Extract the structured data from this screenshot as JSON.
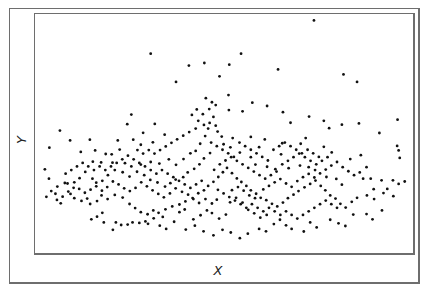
{
  "chart_data": {
    "type": "scatter",
    "title": "",
    "xlabel": "X",
    "ylabel": "Y",
    "xlim": [
      0,
      1
    ],
    "ylim": [
      0,
      1
    ],
    "grid": false,
    "legend": null,
    "ticks": "none",
    "marker_color": "#111111",
    "marker_radius": 1.4,
    "note": "Coordinates normalized to the plot area (x from left edge, y from bottom edge); no axis ticks or numeric labels are shown.",
    "points": [
      [
        0.738,
        0.973
      ],
      [
        0.545,
        0.834
      ],
      [
        0.514,
        0.788
      ],
      [
        0.643,
        0.768
      ],
      [
        0.816,
        0.747
      ],
      [
        0.852,
        0.716
      ],
      [
        0.407,
        0.784
      ],
      [
        0.488,
        0.739
      ],
      [
        0.306,
        0.834
      ],
      [
        0.448,
        0.795
      ],
      [
        0.373,
        0.716
      ],
      [
        0.512,
        0.661
      ],
      [
        0.575,
        0.629
      ],
      [
        0.549,
        0.593
      ],
      [
        0.468,
        0.631
      ],
      [
        0.513,
        0.598
      ],
      [
        0.614,
        0.615
      ],
      [
        0.656,
        0.589
      ],
      [
        0.676,
        0.545
      ],
      [
        0.725,
        0.571
      ],
      [
        0.764,
        0.553
      ],
      [
        0.778,
        0.522
      ],
      [
        0.812,
        0.537
      ],
      [
        0.857,
        0.542
      ],
      [
        0.959,
        0.558
      ],
      [
        0.911,
        0.502
      ],
      [
        0.958,
        0.448
      ],
      [
        0.962,
        0.429
      ],
      [
        0.965,
        0.398
      ],
      [
        0.862,
        0.409
      ],
      [
        0.877,
        0.359
      ],
      [
        0.834,
        0.393
      ],
      [
        0.785,
        0.421
      ],
      [
        0.764,
        0.444
      ],
      [
        0.716,
        0.481
      ],
      [
        0.703,
        0.457
      ],
      [
        0.654,
        0.459
      ],
      [
        0.651,
        0.413
      ],
      [
        0.608,
        0.475
      ],
      [
        0.593,
        0.443
      ],
      [
        0.571,
        0.486
      ],
      [
        0.523,
        0.481
      ],
      [
        0.517,
        0.442
      ],
      [
        0.542,
        0.42
      ],
      [
        0.571,
        0.401
      ],
      [
        0.583,
        0.37
      ],
      [
        0.614,
        0.361
      ],
      [
        0.636,
        0.351
      ],
      [
        0.671,
        0.355
      ],
      [
        0.701,
        0.366
      ],
      [
        0.724,
        0.359
      ],
      [
        0.741,
        0.347
      ],
      [
        0.771,
        0.318
      ],
      [
        0.797,
        0.31
      ],
      [
        0.812,
        0.286
      ],
      [
        0.868,
        0.311
      ],
      [
        0.888,
        0.311
      ],
      [
        0.917,
        0.304
      ],
      [
        0.896,
        0.267
      ],
      [
        0.932,
        0.268
      ],
      [
        0.947,
        0.304
      ],
      [
        0.962,
        0.289
      ],
      [
        0.978,
        0.299
      ],
      [
        0.255,
        0.579
      ],
      [
        0.244,
        0.539
      ],
      [
        0.286,
        0.503
      ],
      [
        0.317,
        0.54
      ],
      [
        0.343,
        0.495
      ],
      [
        0.312,
        0.463
      ],
      [
        0.28,
        0.453
      ],
      [
        0.26,
        0.474
      ],
      [
        0.224,
        0.433
      ],
      [
        0.219,
        0.471
      ],
      [
        0.203,
        0.413
      ],
      [
        0.187,
        0.414
      ],
      [
        0.159,
        0.429
      ],
      [
        0.145,
        0.474
      ],
      [
        0.121,
        0.423
      ],
      [
        0.093,
        0.471
      ],
      [
        0.066,
        0.512
      ],
      [
        0.038,
        0.441
      ],
      [
        0.153,
        0.382
      ],
      [
        0.175,
        0.379
      ],
      [
        0.205,
        0.378
      ],
      [
        0.238,
        0.376
      ],
      [
        0.255,
        0.362
      ],
      [
        0.28,
        0.37
      ],
      [
        0.306,
        0.381
      ],
      [
        0.329,
        0.374
      ],
      [
        0.354,
        0.392
      ],
      [
        0.373,
        0.369
      ],
      [
        0.393,
        0.393
      ],
      [
        0.411,
        0.417
      ],
      [
        0.425,
        0.427
      ],
      [
        0.437,
        0.457
      ],
      [
        0.45,
        0.489
      ],
      [
        0.458,
        0.521
      ],
      [
        0.462,
        0.544
      ],
      [
        0.472,
        0.569
      ],
      [
        0.478,
        0.533
      ],
      [
        0.483,
        0.508
      ],
      [
        0.494,
        0.487
      ],
      [
        0.499,
        0.455
      ],
      [
        0.463,
        0.418
      ],
      [
        0.447,
        0.396
      ],
      [
        0.435,
        0.371
      ],
      [
        0.421,
        0.352
      ],
      [
        0.404,
        0.337
      ],
      [
        0.392,
        0.317
      ],
      [
        0.372,
        0.307
      ],
      [
        0.358,
        0.292
      ],
      [
        0.344,
        0.278
      ],
      [
        0.324,
        0.295
      ],
      [
        0.305,
        0.306
      ],
      [
        0.289,
        0.326
      ],
      [
        0.27,
        0.34
      ],
      [
        0.25,
        0.32
      ],
      [
        0.232,
        0.338
      ],
      [
        0.211,
        0.347
      ],
      [
        0.193,
        0.326
      ],
      [
        0.178,
        0.302
      ],
      [
        0.162,
        0.294
      ],
      [
        0.152,
        0.311
      ],
      [
        0.133,
        0.339
      ],
      [
        0.118,
        0.313
      ],
      [
        0.104,
        0.296
      ],
      [
        0.086,
        0.291
      ],
      [
        0.059,
        0.278
      ],
      [
        0.026,
        0.35
      ],
      [
        0.037,
        0.311
      ],
      [
        0.03,
        0.235
      ],
      [
        0.054,
        0.248
      ],
      [
        0.068,
        0.208
      ],
      [
        0.079,
        0.293
      ],
      [
        0.094,
        0.247
      ],
      [
        0.104,
        0.229
      ],
      [
        0.123,
        0.218
      ],
      [
        0.138,
        0.228
      ],
      [
        0.146,
        0.205
      ],
      [
        0.164,
        0.217
      ],
      [
        0.176,
        0.241
      ],
      [
        0.192,
        0.226
      ],
      [
        0.211,
        0.243
      ],
      [
        0.232,
        0.232
      ],
      [
        0.25,
        0.205
      ],
      [
        0.265,
        0.188
      ],
      [
        0.28,
        0.171
      ],
      [
        0.298,
        0.162
      ],
      [
        0.313,
        0.178
      ],
      [
        0.327,
        0.168
      ],
      [
        0.345,
        0.183
      ],
      [
        0.363,
        0.195
      ],
      [
        0.382,
        0.203
      ],
      [
        0.398,
        0.216
      ],
      [
        0.417,
        0.23
      ],
      [
        0.432,
        0.25
      ],
      [
        0.447,
        0.262
      ],
      [
        0.458,
        0.281
      ],
      [
        0.472,
        0.298
      ],
      [
        0.485,
        0.318
      ],
      [
        0.497,
        0.338
      ],
      [
        0.508,
        0.356
      ],
      [
        0.521,
        0.334
      ],
      [
        0.534,
        0.312
      ],
      [
        0.546,
        0.297
      ],
      [
        0.559,
        0.281
      ],
      [
        0.571,
        0.262
      ],
      [
        0.585,
        0.248
      ],
      [
        0.597,
        0.231
      ],
      [
        0.612,
        0.221
      ],
      [
        0.627,
        0.206
      ],
      [
        0.641,
        0.195
      ],
      [
        0.656,
        0.211
      ],
      [
        0.669,
        0.229
      ],
      [
        0.684,
        0.244
      ],
      [
        0.697,
        0.259
      ],
      [
        0.713,
        0.275
      ],
      [
        0.728,
        0.289
      ],
      [
        0.742,
        0.303
      ],
      [
        0.756,
        0.281
      ],
      [
        0.768,
        0.262
      ],
      [
        0.781,
        0.241
      ],
      [
        0.795,
        0.228
      ],
      [
        0.808,
        0.206
      ],
      [
        0.822,
        0.19
      ],
      [
        0.838,
        0.214
      ],
      [
        0.852,
        0.231
      ],
      [
        0.878,
        0.241
      ],
      [
        0.897,
        0.226
      ],
      [
        0.922,
        0.251
      ],
      [
        0.948,
        0.238
      ],
      [
        0.178,
        0.168
      ],
      [
        0.164,
        0.152
      ],
      [
        0.149,
        0.141
      ],
      [
        0.182,
        0.128
      ],
      [
        0.214,
        0.128
      ],
      [
        0.228,
        0.117
      ],
      [
        0.206,
        0.097
      ],
      [
        0.245,
        0.119
      ],
      [
        0.258,
        0.128
      ],
      [
        0.276,
        0.126
      ],
      [
        0.292,
        0.132
      ],
      [
        0.33,
        0.114
      ],
      [
        0.347,
        0.101
      ],
      [
        0.368,
        0.131
      ],
      [
        0.399,
        0.098
      ],
      [
        0.423,
        0.114
      ],
      [
        0.446,
        0.091
      ],
      [
        0.472,
        0.074
      ],
      [
        0.496,
        0.097
      ],
      [
        0.518,
        0.086
      ],
      [
        0.542,
        0.062
      ],
      [
        0.563,
        0.081
      ],
      [
        0.593,
        0.101
      ],
      [
        0.611,
        0.091
      ],
      [
        0.632,
        0.121
      ],
      [
        0.648,
        0.139
      ],
      [
        0.664,
        0.116
      ],
      [
        0.679,
        0.101
      ],
      [
        0.711,
        0.09
      ],
      [
        0.728,
        0.128
      ],
      [
        0.745,
        0.107
      ],
      [
        0.781,
        0.139
      ],
      [
        0.803,
        0.124
      ],
      [
        0.821,
        0.113
      ],
      [
        0.842,
        0.161
      ],
      [
        0.877,
        0.163
      ],
      [
        0.893,
        0.141
      ],
      [
        0.918,
        0.178
      ],
      [
        0.564,
        0.181
      ],
      [
        0.58,
        0.166
      ],
      [
        0.596,
        0.148
      ],
      [
        0.613,
        0.159
      ],
      [
        0.505,
        0.161
      ],
      [
        0.487,
        0.144
      ],
      [
        0.468,
        0.167
      ],
      [
        0.455,
        0.178
      ],
      [
        0.438,
        0.158
      ],
      [
        0.419,
        0.141
      ],
      [
        0.382,
        0.171
      ],
      [
        0.396,
        0.182
      ],
      [
        0.338,
        0.151
      ],
      [
        0.314,
        0.145
      ],
      [
        0.299,
        0.122
      ],
      [
        0.516,
        0.212
      ],
      [
        0.532,
        0.231
      ],
      [
        0.549,
        0.211
      ],
      [
        0.481,
        0.223
      ],
      [
        0.468,
        0.207
      ],
      [
        0.451,
        0.226
      ],
      [
        0.434,
        0.209
      ],
      [
        0.419,
        0.226
      ],
      [
        0.405,
        0.244
      ],
      [
        0.389,
        0.256
      ],
      [
        0.372,
        0.271
      ],
      [
        0.357,
        0.249
      ],
      [
        0.341,
        0.233
      ],
      [
        0.326,
        0.247
      ],
      [
        0.311,
        0.262
      ],
      [
        0.296,
        0.279
      ],
      [
        0.281,
        0.296
      ],
      [
        0.266,
        0.272
      ],
      [
        0.251,
        0.259
      ],
      [
        0.236,
        0.271
      ],
      [
        0.221,
        0.287
      ],
      [
        0.206,
        0.299
      ],
      [
        0.191,
        0.276
      ],
      [
        0.177,
        0.261
      ],
      [
        0.162,
        0.279
      ],
      [
        0.147,
        0.265
      ],
      [
        0.132,
        0.252
      ],
      [
        0.117,
        0.268
      ],
      [
        0.102,
        0.273
      ],
      [
        0.088,
        0.257
      ],
      [
        0.073,
        0.236
      ],
      [
        0.058,
        0.222
      ],
      [
        0.043,
        0.259
      ],
      [
        0.521,
        0.263
      ],
      [
        0.537,
        0.276
      ],
      [
        0.552,
        0.261
      ],
      [
        0.567,
        0.241
      ],
      [
        0.582,
        0.229
      ],
      [
        0.604,
        0.266
      ],
      [
        0.619,
        0.281
      ],
      [
        0.634,
        0.296
      ],
      [
        0.649,
        0.309
      ],
      [
        0.664,
        0.291
      ],
      [
        0.679,
        0.277
      ],
      [
        0.694,
        0.301
      ],
      [
        0.709,
        0.317
      ],
      [
        0.724,
        0.331
      ],
      [
        0.739,
        0.316
      ],
      [
        0.754,
        0.333
      ],
      [
        0.769,
        0.349
      ],
      [
        0.784,
        0.366
      ],
      [
        0.799,
        0.381
      ],
      [
        0.814,
        0.359
      ],
      [
        0.829,
        0.342
      ],
      [
        0.844,
        0.326
      ],
      [
        0.859,
        0.337
      ],
      [
        0.474,
        0.348
      ],
      [
        0.489,
        0.371
      ],
      [
        0.504,
        0.387
      ],
      [
        0.519,
        0.401
      ],
      [
        0.534,
        0.386
      ],
      [
        0.549,
        0.371
      ],
      [
        0.564,
        0.356
      ],
      [
        0.579,
        0.341
      ],
      [
        0.594,
        0.326
      ],
      [
        0.609,
        0.311
      ],
      [
        0.624,
        0.326
      ],
      [
        0.639,
        0.341
      ],
      [
        0.654,
        0.371
      ],
      [
        0.669,
        0.386
      ],
      [
        0.684,
        0.401
      ],
      [
        0.699,
        0.416
      ],
      [
        0.714,
        0.401
      ],
      [
        0.729,
        0.386
      ],
      [
        0.744,
        0.371
      ],
      [
        0.759,
        0.386
      ],
      [
        0.774,
        0.401
      ],
      [
        0.441,
        0.302
      ],
      [
        0.426,
        0.287
      ],
      [
        0.411,
        0.272
      ],
      [
        0.396,
        0.287
      ],
      [
        0.381,
        0.302
      ],
      [
        0.366,
        0.317
      ],
      [
        0.351,
        0.332
      ],
      [
        0.336,
        0.347
      ],
      [
        0.321,
        0.332
      ],
      [
        0.306,
        0.347
      ],
      [
        0.291,
        0.362
      ],
      [
        0.276,
        0.377
      ],
      [
        0.261,
        0.392
      ],
      [
        0.246,
        0.407
      ],
      [
        0.231,
        0.392
      ],
      [
        0.216,
        0.377
      ],
      [
        0.201,
        0.362
      ],
      [
        0.186,
        0.347
      ],
      [
        0.171,
        0.362
      ],
      [
        0.156,
        0.347
      ],
      [
        0.141,
        0.362
      ],
      [
        0.126,
        0.377
      ],
      [
        0.111,
        0.362
      ],
      [
        0.096,
        0.347
      ],
      [
        0.081,
        0.332
      ],
      [
        0.444,
        0.581
      ],
      [
        0.461,
        0.602
      ],
      [
        0.478,
        0.619
      ],
      [
        0.452,
        0.648
      ],
      [
        0.428,
        0.601
      ],
      [
        0.415,
        0.578
      ],
      [
        0.432,
        0.553
      ],
      [
        0.447,
        0.536
      ],
      [
        0.425,
        0.521
      ],
      [
        0.408,
        0.506
      ],
      [
        0.392,
        0.491
      ],
      [
        0.376,
        0.476
      ],
      [
        0.361,
        0.461
      ],
      [
        0.346,
        0.446
      ],
      [
        0.331,
        0.431
      ],
      [
        0.316,
        0.416
      ],
      [
        0.301,
        0.431
      ],
      [
        0.286,
        0.416
      ],
      [
        0.271,
        0.431
      ],
      [
        0.466,
        0.462
      ],
      [
        0.481,
        0.447
      ],
      [
        0.496,
        0.432
      ],
      [
        0.511,
        0.417
      ],
      [
        0.526,
        0.402
      ],
      [
        0.541,
        0.462
      ],
      [
        0.556,
        0.447
      ],
      [
        0.571,
        0.432
      ],
      [
        0.586,
        0.417
      ],
      [
        0.601,
        0.402
      ],
      [
        0.616,
        0.387
      ],
      [
        0.631,
        0.432
      ],
      [
        0.646,
        0.447
      ],
      [
        0.661,
        0.462
      ],
      [
        0.676,
        0.447
      ],
      [
        0.691,
        0.432
      ],
      [
        0.706,
        0.417
      ],
      [
        0.721,
        0.432
      ],
      [
        0.736,
        0.417
      ],
      [
        0.751,
        0.402
      ],
      [
        0.484,
        0.264
      ],
      [
        0.499,
        0.249
      ],
      [
        0.514,
        0.234
      ],
      [
        0.529,
        0.219
      ],
      [
        0.544,
        0.204
      ],
      [
        0.559,
        0.189
      ],
      [
        0.574,
        0.204
      ],
      [
        0.589,
        0.189
      ],
      [
        0.604,
        0.174
      ],
      [
        0.619,
        0.189
      ],
      [
        0.634,
        0.174
      ],
      [
        0.649,
        0.159
      ],
      [
        0.664,
        0.174
      ],
      [
        0.679,
        0.159
      ],
      [
        0.694,
        0.144
      ],
      [
        0.709,
        0.159
      ],
      [
        0.724,
        0.174
      ],
      [
        0.739,
        0.189
      ],
      [
        0.754,
        0.204
      ],
      [
        0.769,
        0.219
      ],
      [
        0.784,
        0.204
      ],
      [
        0.799,
        0.189
      ]
    ]
  },
  "axes": {
    "x_label": "X",
    "y_label": "Y"
  },
  "colors": {
    "frame": "#6e6e6e",
    "marker": "#111111",
    "background": "#ffffff"
  }
}
